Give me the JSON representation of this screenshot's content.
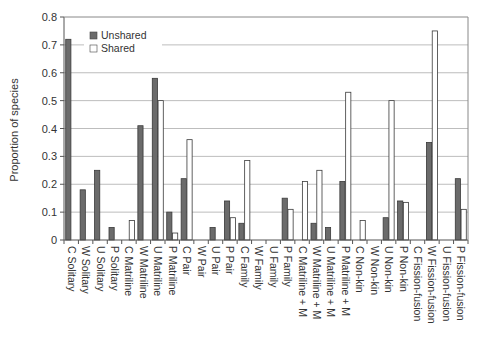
{
  "chart_data": {
    "type": "bar",
    "title": "",
    "xlabel": "",
    "ylabel": "Proportion of species",
    "ylim": [
      0,
      0.8
    ],
    "yticks": [
      "0",
      "0.1",
      "0.2",
      "0.3",
      "0.4",
      "0.5",
      "0.6",
      "0.7",
      "0.8"
    ],
    "grid": true,
    "legend_position": "upper-left",
    "categories": [
      "C Solitary",
      "W Solitary",
      "U Solitary",
      "P Solitary",
      "C Matriline",
      "W Matriline",
      "U Matriline",
      "P Matriline",
      "C Pair",
      "W Pair",
      "U Pair",
      "P Pair",
      "C Family",
      "W Family",
      "U Family",
      "P Family",
      "C Matriline + M",
      "W Matriline + M",
      "U Matriline + M",
      "P Matriline + M",
      "C Non-kin",
      "W Non-kin",
      "U Non-kin",
      "P Non-kin",
      "C Fission-fusion",
      "W Fission-fusion",
      "U Fission-fusion",
      "P Fission-fusion"
    ],
    "series": [
      {
        "name": "Unshared",
        "color": "#6b6b6b",
        "values": [
          0.72,
          0.18,
          0.25,
          0.045,
          0,
          0.41,
          0.58,
          0.1,
          0.22,
          0,
          0.045,
          0.14,
          0.06,
          0,
          0,
          0.15,
          0,
          0.06,
          0.045,
          0.21,
          0,
          0,
          0.08,
          0.14,
          0,
          0.35,
          0,
          0.22
        ]
      },
      {
        "name": "Shared",
        "color": "#ffffff",
        "values": [
          0,
          0,
          0,
          0,
          0.07,
          0,
          0.5,
          0.025,
          0.36,
          0,
          0,
          0.08,
          0.285,
          0,
          0,
          0.11,
          0.21,
          0.25,
          0,
          0.53,
          0.07,
          0,
          0.5,
          0.135,
          0,
          0.75,
          0,
          0.11
        ]
      }
    ]
  }
}
